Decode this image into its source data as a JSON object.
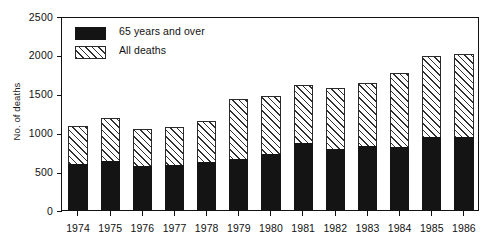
{
  "chart_data": {
    "type": "bar",
    "subtype": "stacked-bar",
    "title": "",
    "xlabel": "",
    "ylabel": "No. of deaths",
    "categories": [
      "1974",
      "1975",
      "1976",
      "1977",
      "1978",
      "1979",
      "1980",
      "1981",
      "1982",
      "1983",
      "1984",
      "1985",
      "1986"
    ],
    "series": [
      {
        "name": "65 years and over",
        "fill": "solid-black",
        "color": "#141414",
        "values": [
          590,
          635,
          570,
          575,
          620,
          655,
          720,
          860,
          785,
          820,
          810,
          940,
          935
        ]
      },
      {
        "name": "All deaths",
        "fill": "diagonal-hatch",
        "color": "#2e2e2e",
        "note": "bar total height; hatched portion is the remainder above the 65-and-over segment",
        "values": [
          1080,
          1180,
          1045,
          1075,
          1145,
          1425,
          1475,
          1610,
          1570,
          1640,
          1765,
          1985,
          2005
        ]
      }
    ],
    "ylim": [
      0,
      2500
    ],
    "yticks": [
      0,
      500,
      1000,
      1500,
      2000,
      2500
    ],
    "ytick_labels": [
      "0",
      "500",
      "1000",
      "1500",
      "2000",
      "2500"
    ],
    "grid": false,
    "legend_position": "top-left-inside",
    "legend_entries": [
      {
        "label": "65 years and over",
        "swatch": "solid"
      },
      {
        "label": "All deaths",
        "swatch": "hatch"
      }
    ]
  }
}
